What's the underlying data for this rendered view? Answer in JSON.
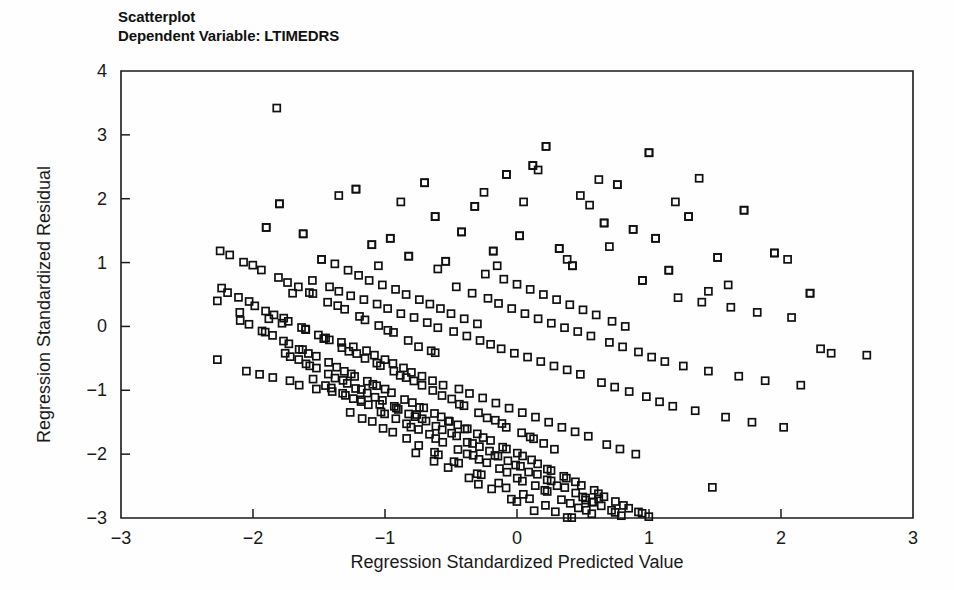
{
  "figure": {
    "title_line1": "Scatterplot",
    "title_line2": "Dependent Variable: LTIMEDRS",
    "background_color": "#fefefe",
    "marker_color": "#111111",
    "axis_color": "#1b1b1b"
  },
  "chart_data": {
    "type": "scatter",
    "title": "Scatterplot",
    "subtitle": "Dependent Variable: LTIMEDRS",
    "xlabel": "Regression Standardized Predicted Value",
    "ylabel": "Regression Standardized Residual",
    "xlim": [
      -3,
      3
    ],
    "ylim": [
      -3,
      4
    ],
    "xticks": [
      -3,
      -2,
      -1,
      0,
      1,
      2,
      3
    ],
    "xtick_labels": [
      "−3",
      "−2",
      "−1",
      "0",
      "1",
      "2",
      "3"
    ],
    "yticks": [
      -3,
      -2,
      -1,
      0,
      1,
      2,
      3,
      4
    ],
    "ytick_labels": [
      "−3",
      "−2",
      "−1",
      "0",
      "1",
      "2",
      "3",
      "4"
    ],
    "grid": false,
    "legend": false,
    "marker": "open-square",
    "marker_size": 7,
    "n_points": 465,
    "bands": [
      {
        "intercept": 3.42,
        "x_from": -1.82,
        "x_to": -1.82,
        "count": 1
      },
      {
        "intercept": 1.22,
        "x_from": -2.27,
        "x_to": -0.55,
        "count": 22
      },
      {
        "intercept": 0.62,
        "x_from": -2.27,
        "x_to": 0.3,
        "count": 40
      },
      {
        "intercept": 0.1,
        "x_from": -2.1,
        "x_to": 1.05,
        "count": 55
      },
      {
        "intercept": -0.38,
        "x_from": -1.8,
        "x_to": 1.5,
        "count": 60
      },
      {
        "intercept": -0.82,
        "x_from": -1.55,
        "x_to": 1.85,
        "count": 52
      },
      {
        "intercept": -1.3,
        "x_from": -1.3,
        "x_to": 2.1,
        "count": 40
      },
      {
        "intercept": -1.95,
        "x_from": -0.8,
        "x_to": 2.35,
        "count": 28
      }
    ],
    "x_range_observed": [
      -2.27,
      2.65
    ],
    "y_range_observed": [
      -2.75,
      3.42
    ],
    "points": [
      [
        -2.27,
        0.4
      ],
      [
        -2.27,
        -0.52
      ],
      [
        -2.1,
        0.22
      ],
      [
        -2.05,
        -0.7
      ],
      [
        -1.95,
        -0.75
      ],
      [
        -1.9,
        1.55
      ],
      [
        -1.88,
        0.12
      ],
      [
        -1.85,
        -0.8
      ],
      [
        -1.82,
        3.42
      ],
      [
        -1.8,
        1.92
      ],
      [
        -1.78,
        0.05
      ],
      [
        -1.72,
        -0.85
      ],
      [
        -1.7,
        0.52
      ],
      [
        -1.65,
        -0.92
      ],
      [
        -1.62,
        1.45
      ],
      [
        -1.6,
        -0.05
      ],
      [
        -1.55,
        0.72
      ],
      [
        -1.52,
        -0.98
      ],
      [
        -1.48,
        1.05
      ],
      [
        -1.45,
        -0.18
      ],
      [
        -1.42,
        0.62
      ],
      [
        -1.4,
        -1.02
      ],
      [
        -1.38,
        0.98
      ],
      [
        -1.35,
        0.55
      ],
      [
        -1.33,
        -0.25
      ],
      [
        -1.3,
        -1.08
      ],
      [
        -1.28,
        0.88
      ],
      [
        -1.26,
        0.48
      ],
      [
        -1.24,
        -0.32
      ],
      [
        -1.22,
        2.15
      ],
      [
        -1.2,
        0.8
      ],
      [
        -1.18,
        -1.15
      ],
      [
        -1.16,
        0.42
      ],
      [
        -1.14,
        -0.38
      ],
      [
        -1.12,
        0.72
      ],
      [
        -1.1,
        1.28
      ],
      [
        -1.08,
        -0.45
      ],
      [
        -1.06,
        0.35
      ],
      [
        -1.04,
        -1.22
      ],
      [
        -1.02,
        0.65
      ],
      [
        -1.0,
        -0.52
      ],
      [
        -0.98,
        0.28
      ],
      [
        -0.96,
        1.38
      ],
      [
        -0.94,
        -0.58
      ],
      [
        -0.92,
        0.58
      ],
      [
        -0.9,
        -1.3
      ],
      [
        -0.88,
        0.2
      ],
      [
        -0.86,
        -0.65
      ],
      [
        -0.84,
        0.5
      ],
      [
        -0.82,
        1.1
      ],
      [
        -0.8,
        -0.72
      ],
      [
        -0.78,
        0.14
      ],
      [
        -0.76,
        -1.38
      ],
      [
        -0.74,
        0.42
      ],
      [
        -0.72,
        -0.78
      ],
      [
        -0.7,
        2.25
      ],
      [
        -0.68,
        0.06
      ],
      [
        -0.66,
        0.35
      ],
      [
        -0.64,
        -0.85
      ],
      [
        -0.62,
        1.72
      ],
      [
        -0.6,
        -0.02
      ],
      [
        -0.58,
        0.28
      ],
      [
        -0.56,
        -0.92
      ],
      [
        -0.54,
        1.02
      ],
      [
        -0.52,
        -1.48
      ],
      [
        -0.5,
        0.2
      ],
      [
        -0.48,
        -0.08
      ],
      [
        -0.46,
        0.62
      ],
      [
        -0.44,
        -0.98
      ],
      [
        -0.42,
        1.48
      ],
      [
        -0.4,
        0.12
      ],
      [
        -0.38,
        -0.15
      ],
      [
        -0.36,
        -1.05
      ],
      [
        -0.34,
        0.52
      ],
      [
        -0.32,
        1.88
      ],
      [
        -0.3,
        0.04
      ],
      [
        -0.28,
        -0.22
      ],
      [
        -0.26,
        -1.12
      ],
      [
        -0.24,
        0.82
      ],
      [
        -0.22,
        0.44
      ],
      [
        -0.2,
        -0.28
      ],
      [
        -0.18,
        1.18
      ],
      [
        -0.16,
        -1.2
      ],
      [
        -0.14,
        0.36
      ],
      [
        -0.12,
        -0.35
      ],
      [
        -0.1,
        0.74
      ],
      [
        -0.08,
        2.38
      ],
      [
        -0.06,
        -1.28
      ],
      [
        -0.04,
        0.28
      ],
      [
        -0.02,
        -0.42
      ],
      [
        0.0,
        0.66
      ],
      [
        0.02,
        1.42
      ],
      [
        0.04,
        -1.35
      ],
      [
        0.06,
        0.2
      ],
      [
        0.08,
        -0.48
      ],
      [
        0.1,
        0.58
      ],
      [
        0.12,
        2.52
      ],
      [
        0.14,
        -1.42
      ],
      [
        0.16,
        0.12
      ],
      [
        0.18,
        -0.55
      ],
      [
        0.2,
        0.5
      ],
      [
        0.22,
        2.82
      ],
      [
        0.24,
        -1.5
      ],
      [
        0.26,
        0.05
      ],
      [
        0.28,
        -0.62
      ],
      [
        0.3,
        0.42
      ],
      [
        0.32,
        1.22
      ],
      [
        0.34,
        -1.58
      ],
      [
        0.36,
        -0.02
      ],
      [
        0.38,
        -0.68
      ],
      [
        0.4,
        0.34
      ],
      [
        0.42,
        0.95
      ],
      [
        0.44,
        -1.65
      ],
      [
        0.46,
        -0.08
      ],
      [
        0.48,
        -0.75
      ],
      [
        0.5,
        0.26
      ],
      [
        0.52,
        -2.72
      ],
      [
        0.54,
        -1.72
      ],
      [
        0.56,
        -0.15
      ],
      [
        0.58,
        -2.75
      ],
      [
        0.6,
        0.18
      ],
      [
        0.62,
        -2.7
      ],
      [
        0.64,
        -0.88
      ],
      [
        0.66,
        1.62
      ],
      [
        0.68,
        -1.85
      ],
      [
        0.7,
        -0.25
      ],
      [
        0.72,
        0.08
      ],
      [
        0.74,
        -0.95
      ],
      [
        0.76,
        2.22
      ],
      [
        0.78,
        -1.92
      ],
      [
        0.8,
        -0.32
      ],
      [
        0.82,
        0.0
      ],
      [
        0.85,
        -1.02
      ],
      [
        0.88,
        1.52
      ],
      [
        0.9,
        -2.0
      ],
      [
        0.92,
        -0.4
      ],
      [
        0.95,
        0.72
      ],
      [
        0.98,
        -1.1
      ],
      [
        1.0,
        2.72
      ],
      [
        1.02,
        -0.48
      ],
      [
        1.05,
        1.38
      ],
      [
        1.08,
        -1.18
      ],
      [
        1.12,
        -0.55
      ],
      [
        1.15,
        0.88
      ],
      [
        1.18,
        -1.25
      ],
      [
        1.22,
        0.45
      ],
      [
        1.26,
        -0.62
      ],
      [
        1.3,
        1.72
      ],
      [
        1.35,
        -1.32
      ],
      [
        1.4,
        0.38
      ],
      [
        1.45,
        -0.7
      ],
      [
        1.48,
        -2.52
      ],
      [
        1.52,
        1.08
      ],
      [
        1.58,
        -1.42
      ],
      [
        1.62,
        0.3
      ],
      [
        1.68,
        -0.78
      ],
      [
        1.72,
        1.82
      ],
      [
        1.78,
        -1.5
      ],
      [
        1.82,
        0.22
      ],
      [
        1.88,
        -0.85
      ],
      [
        1.95,
        1.15
      ],
      [
        2.02,
        -1.58
      ],
      [
        2.08,
        0.14
      ],
      [
        2.15,
        -0.92
      ],
      [
        2.22,
        0.52
      ],
      [
        2.3,
        -0.35
      ],
      [
        2.38,
        -0.42
      ],
      [
        2.65,
        -0.45
      ]
    ]
  }
}
